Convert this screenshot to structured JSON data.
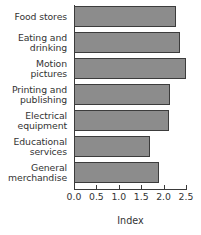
{
  "chart_data": {
    "type": "bar",
    "orientation": "horizontal",
    "title": "",
    "xlabel": "Index",
    "ylabel": "",
    "categories": [
      "Food stores",
      "Eating and drinking",
      "Motion pictures",
      "Printing and publishing",
      "Electrical equipment",
      "Educational services",
      "General merchandise"
    ],
    "values": [
      2.27,
      2.36,
      2.5,
      2.15,
      2.11,
      1.7,
      1.9
    ],
    "xlim": [
      0.0,
      2.5
    ],
    "xticks": [
      0.0,
      0.5,
      1.0,
      1.5,
      2.0,
      2.5
    ],
    "xticklabels": [
      "0.0",
      "0.5",
      "1.0",
      "1.5",
      "2.0",
      "2.5"
    ],
    "grid": false,
    "legend": null,
    "bar_color": "#8c8c8c",
    "bar_edge_color": "#3c3c3c",
    "axis_color": "#3a3a3a",
    "text_color": "#333333"
  },
  "category_label_lines": [
    [
      "Food stores"
    ],
    [
      "Eating and",
      "drinking"
    ],
    [
      "Motion",
      "pictures"
    ],
    [
      "Printing and",
      "publishing"
    ],
    [
      "Electrical",
      "equipment"
    ],
    [
      "Educational",
      "services"
    ],
    [
      "General",
      "merchandise"
    ]
  ]
}
